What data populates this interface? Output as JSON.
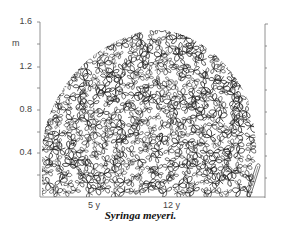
{
  "figure": {
    "y_axis": {
      "unit": "m",
      "ticks": [
        {
          "label": "1.6",
          "y": 22
        },
        {
          "label": "1.2",
          "y": 67
        },
        {
          "label": "0.8",
          "y": 110
        },
        {
          "label": "0.4",
          "y": 153
        }
      ]
    },
    "x_axis": {
      "labels": [
        {
          "label": "5 y",
          "x": 92
        },
        {
          "label": "12 y",
          "x": 170
        }
      ]
    },
    "caption": "Syringa meyeri.",
    "colors": {
      "ink": "#222222",
      "axis": "#777777"
    }
  }
}
